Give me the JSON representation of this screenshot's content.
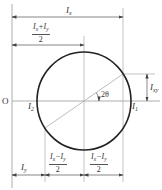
{
  "diagram": {
    "colors": {
      "circle": "#222222",
      "lines": "#999999",
      "text": "#333333",
      "background": "#ffffff"
    },
    "origin_label": "O",
    "labels": {
      "Ix_top": {
        "main": "I",
        "sub": "x"
      },
      "half_sum": {
        "num_a": "I",
        "num_a_sub": "x",
        "op": "+",
        "num_b": "I",
        "num_b_sub": "y",
        "den": "2"
      },
      "Ixy": {
        "main": "I",
        "sub": "xy"
      },
      "I1": {
        "main": "I",
        "sub": "1"
      },
      "I2": {
        "main": "I",
        "sub": "2"
      },
      "angle": "2θ",
      "Iy_bottom": {
        "main": "I",
        "sub": "y"
      },
      "half_diff_left": {
        "num_a": "I",
        "num_a_sub": "x",
        "op": "−",
        "num_b": "I",
        "num_b_sub": "y",
        "den": "2"
      },
      "half_diff_right": {
        "num_a": "I",
        "num_a_sub": "x",
        "op": "−",
        "num_b": "I",
        "num_b_sub": "y",
        "den": "2"
      }
    },
    "geometry": {
      "origin_x": 12,
      "axis_y": 101,
      "center": [
        84,
        101
      ],
      "radius": 47,
      "point_top_right": [
        123,
        74
      ],
      "point_bottom_left": [
        45,
        128
      ]
    }
  }
}
